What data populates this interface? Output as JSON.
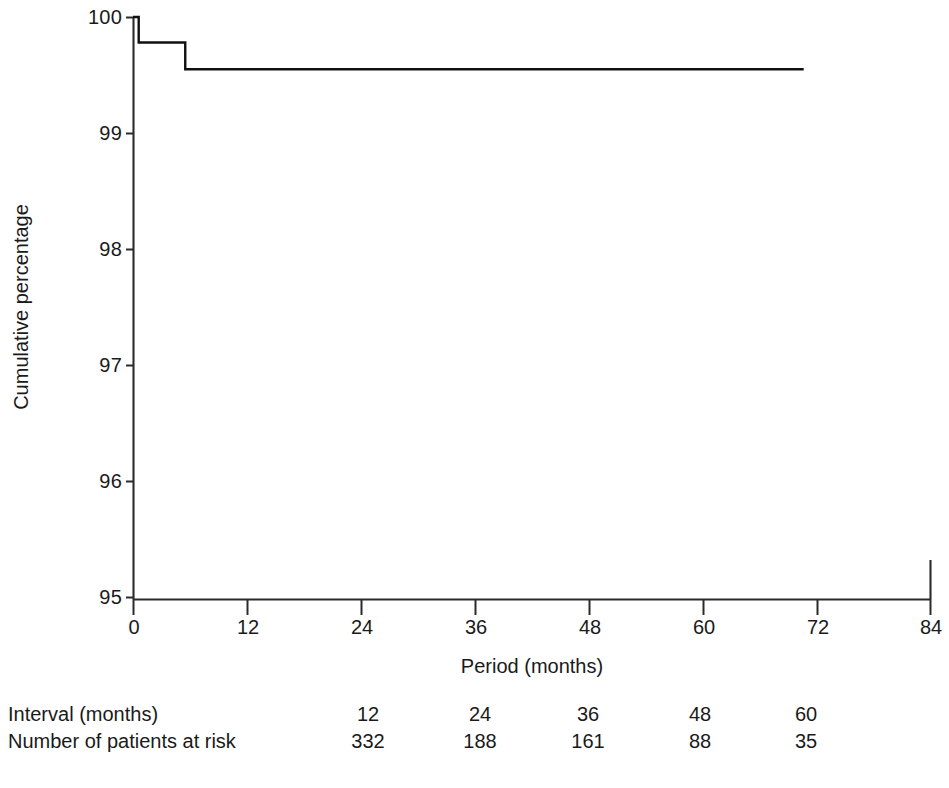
{
  "chart_data": {
    "type": "line",
    "subtype": "kaplan-meier-step",
    "title": "",
    "xlabel": "Period (months)",
    "ylabel": "Cumulative percentage",
    "xlim": [
      0,
      84
    ],
    "ylim": [
      95,
      100
    ],
    "xticks": [
      0,
      12,
      24,
      36,
      48,
      60,
      72,
      84
    ],
    "xtick_labels": [
      "0",
      "12",
      "24",
      "36",
      "48",
      "60",
      "72",
      "84"
    ],
    "yticks": [
      95,
      96,
      97,
      98,
      99,
      100
    ],
    "ytick_labels": [
      "95",
      "96",
      "97",
      "98",
      "99",
      "100"
    ],
    "grid": false,
    "legend": false,
    "line_color": "#101010",
    "series": [
      {
        "name": "Cumulative percentage",
        "step": "post",
        "x": [
          0.0,
          0.6,
          0.6,
          5.5,
          5.5,
          70.6
        ],
        "y": [
          100.0,
          100.0,
          99.78,
          99.78,
          99.55,
          99.55
        ]
      }
    ],
    "annotations": []
  },
  "axis": {
    "y_title": "Cumulative percentage",
    "x_title": "Period (months)"
  },
  "risk_table": {
    "rows": [
      {
        "label": "Interval (months)",
        "values": [
          "12",
          "24",
          "36",
          "48",
          "60"
        ]
      },
      {
        "label": "Number of patients at risk",
        "values": [
          "332",
          "188",
          "161",
          "88",
          "35"
        ]
      }
    ],
    "value_x_positions": [
      360,
      472,
      580,
      692,
      798
    ]
  }
}
